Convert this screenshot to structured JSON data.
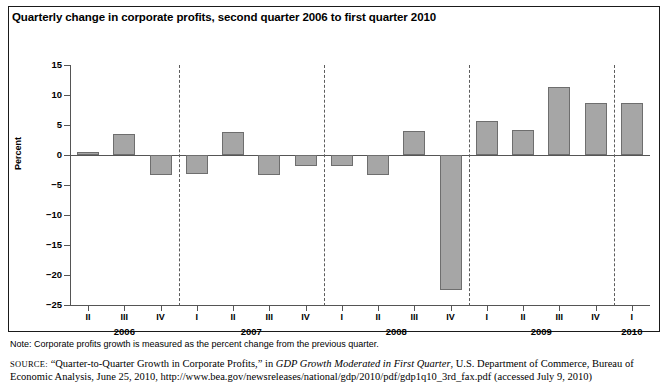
{
  "figure": {
    "title": "Quarterly change in corporate profits, second quarter 2006 to first quarter 2010",
    "y_axis_title": "Percent",
    "note": "Note: Corporate profits growth is measured as the percent change from the previous quarter.",
    "source": {
      "kicker": "SOURCE:",
      "pre_italic": " “Quarter-to-Quarter Growth in Corporate Profits,” in ",
      "italic_title": "GDP Growth Moderated in First Quarter",
      "post_italic": ", U.S. Department of Commerce, Bureau of Economic Analysis, June 25, 2010, http://www.bea.gov/newsreleases/national/gdp/2010/pdf/gdp1q10_3rd_fax.pdf (accessed July 9, 2010)"
    },
    "colors": {
      "bar_fill": "#a6a6a6",
      "bar_stroke": "#6e6e6e",
      "axis": "#555555",
      "separator": "#5c5c5c",
      "frame": "#1a1a1a",
      "text": "#000000"
    }
  },
  "chart_data": {
    "type": "bar",
    "title": "Quarterly change in corporate profits, second quarter 2006 to first quarter 2010",
    "xlabel": "",
    "ylabel": "Percent",
    "ylim": [
      -25,
      15
    ],
    "ytick_labels": [
      "15",
      "10",
      "5",
      "0",
      "−5",
      "−10",
      "−15",
      "−20",
      "−25"
    ],
    "ytick_values": [
      15,
      10,
      5,
      0,
      -5,
      -10,
      -15,
      -20,
      -25
    ],
    "grid": false,
    "legend": "none",
    "categories": [
      "II",
      "III",
      "IV",
      "I",
      "II",
      "III",
      "IV",
      "I",
      "II",
      "III",
      "IV",
      "I",
      "II",
      "III",
      "IV",
      "I"
    ],
    "years": [
      {
        "label": "2006",
        "quarters": [
          "II",
          "III",
          "IV"
        ]
      },
      {
        "label": "2007",
        "quarters": [
          "I",
          "II",
          "III",
          "IV"
        ]
      },
      {
        "label": "2008",
        "quarters": [
          "I",
          "II",
          "III",
          "IV"
        ]
      },
      {
        "label": "2009",
        "quarters": [
          "I",
          "II",
          "III",
          "IV"
        ]
      },
      {
        "label": "2010",
        "quarters": [
          "I"
        ]
      }
    ],
    "year_separators_after_index": [
      2,
      6,
      10,
      14
    ],
    "values": [
      0.3,
      3.5,
      -3.4,
      -3.1,
      3.9,
      -3.3,
      -1.9,
      -1.8,
      -3.4,
      4.0,
      -22.5,
      5.7,
      4.2,
      11.3,
      8.7,
      8.6
    ],
    "points": [
      {
        "year": "2006",
        "quarter": "II",
        "value": 0.3
      },
      {
        "year": "2006",
        "quarter": "III",
        "value": 3.5
      },
      {
        "year": "2006",
        "quarter": "IV",
        "value": -3.4
      },
      {
        "year": "2007",
        "quarter": "I",
        "value": -3.1
      },
      {
        "year": "2007",
        "quarter": "II",
        "value": 3.9
      },
      {
        "year": "2007",
        "quarter": "III",
        "value": -3.3
      },
      {
        "year": "2007",
        "quarter": "IV",
        "value": -1.9
      },
      {
        "year": "2008",
        "quarter": "I",
        "value": -1.8
      },
      {
        "year": "2008",
        "quarter": "II",
        "value": -3.4
      },
      {
        "year": "2008",
        "quarter": "III",
        "value": 4.0
      },
      {
        "year": "2008",
        "quarter": "IV",
        "value": -22.5
      },
      {
        "year": "2009",
        "quarter": "I",
        "value": 5.7
      },
      {
        "year": "2009",
        "quarter": "II",
        "value": 4.2
      },
      {
        "year": "2009",
        "quarter": "III",
        "value": 11.3
      },
      {
        "year": "2009",
        "quarter": "IV",
        "value": 8.7
      },
      {
        "year": "2010",
        "quarter": "I",
        "value": 8.6
      }
    ]
  }
}
